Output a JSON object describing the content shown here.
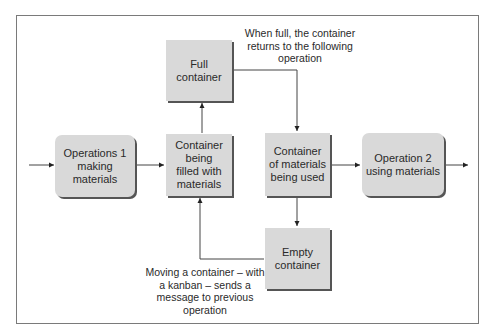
{
  "diagram": {
    "nodes": {
      "operations1": "Operations 1\nmaking\nmaterials",
      "being_filled": "Container\nbeing\nfilled with\nmaterials",
      "full_container": "Full\ncontainer",
      "being_used": "Container\nof materials\nbeing used",
      "operation2": "Operation 2\nusing materials",
      "empty_container": "Empty\ncontainer"
    },
    "annotations": {
      "top": "When full, the container\nreturns to the following\noperation",
      "bottom": "Moving a container – with\na kanban – sends a\nmessage to previous\noperation"
    },
    "colors": {
      "box_fill": "#d9d9d9",
      "shadow": "#555555",
      "line": "#333333",
      "frame": "#7a7a7a"
    }
  }
}
